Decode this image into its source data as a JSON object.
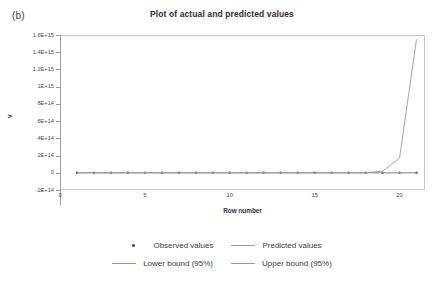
{
  "figure": {
    "panel_label": "(b)",
    "background_color": "#ffffff"
  },
  "chart_data": {
    "type": "line",
    "title": "Plot of actual and predicted values",
    "xlabel": "Row number",
    "ylabel": "v",
    "xlim": [
      0,
      21.5
    ],
    "ylim": [
      -200000000000000.0,
      1600000000000000.0
    ],
    "grid": false,
    "legend_position": "bottom",
    "line_color": "#9b9b9b",
    "marker_color": "#5a5a5a",
    "axis_color": "#a0a0a0",
    "x_ticks": [
      0,
      5,
      10,
      15,
      20
    ],
    "x_tick_labels": [
      "0",
      "5",
      "10",
      "15",
      "20"
    ],
    "y_ticks": [
      -200000000000000.0,
      0,
      200000000000000.0,
      400000000000000.0,
      600000000000000.0,
      800000000000000.0,
      1000000000000000.0,
      1200000000000000.0,
      1400000000000000.0,
      1600000000000000.0
    ],
    "y_tick_labels": [
      "-2E+14",
      "0",
      "2E+14",
      "4E+14",
      "6E+14",
      "8E+14",
      "1E+15",
      "1.2E+15",
      "1.4E+15",
      "1.6E+15"
    ],
    "x": [
      1,
      2,
      3,
      4,
      5,
      6,
      7,
      8,
      9,
      10,
      11,
      12,
      13,
      14,
      15,
      16,
      17,
      18,
      19,
      20,
      21
    ],
    "series": [
      {
        "name": "Observed values",
        "style": "marker",
        "values": [
          0,
          0,
          0,
          0,
          0,
          0,
          0,
          0,
          0,
          0,
          0,
          0,
          0,
          0,
          0,
          0,
          0,
          0,
          0,
          0,
          0
        ]
      },
      {
        "name": "Predicted values",
        "style": "line",
        "values": [
          0,
          0,
          0,
          0,
          0,
          0,
          0,
          0,
          0,
          0,
          0,
          0,
          0,
          0,
          0,
          0,
          0,
          0,
          0,
          0,
          0
        ]
      },
      {
        "name": "Lower bound (95%)",
        "style": "line",
        "values": [
          0,
          0,
          0,
          0,
          0,
          0,
          0,
          0,
          0,
          0,
          0,
          0,
          0,
          0,
          0,
          0,
          0,
          0,
          0,
          0,
          0
        ]
      },
      {
        "name": "Upper bound (95%)",
        "style": "line",
        "values": [
          0,
          0,
          0,
          0,
          0,
          0,
          0,
          0,
          0,
          0,
          0,
          0,
          0,
          0,
          0,
          0,
          0,
          0,
          20000000000000.0,
          170000000000000.0,
          1550000000000000.0
        ]
      }
    ]
  },
  "legend": {
    "rows": [
      [
        {
          "label": "Observed values",
          "marker": "dot"
        },
        {
          "label": "Predicted values",
          "marker": "line"
        }
      ],
      [
        {
          "label": "Lower bound (95%)",
          "marker": "line"
        },
        {
          "label": "Upper bound (95%)",
          "marker": "line"
        }
      ]
    ]
  }
}
